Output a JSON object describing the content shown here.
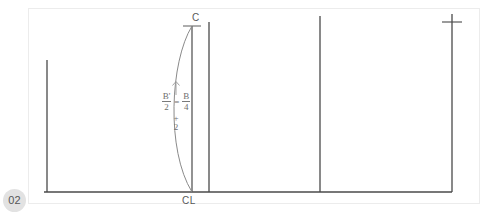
{
  "page": {
    "badge_number": "02",
    "background_color": "#ffffff",
    "frame_color": "#ececec",
    "line_color": "#4a4a4a",
    "text_color": "#585858"
  },
  "diagram": {
    "labels": {
      "top_station": "C",
      "centerline": "CL"
    },
    "annotation": {
      "arrow": "up-arrow",
      "formula_line1_left_num": "B'",
      "formula_line1_left_den": "2",
      "formula_equals": "=",
      "formula_line1_right_num": "B",
      "formula_line1_right_den": "4",
      "formula_line2_operator": "+",
      "formula_line2_value": "2",
      "plain_text": "B'/2 = B/4 + 2"
    }
  },
  "geometry": {
    "baseline": {
      "x1": 44,
      "y1": 192,
      "x2": 452,
      "y2": 192
    },
    "verticals": [
      {
        "name": "left-station-line",
        "x": 47,
        "y_top": 60,
        "y_bottom": 192
      },
      {
        "name": "centerline",
        "x": 192,
        "y_top": 26,
        "y_bottom": 192
      },
      {
        "name": "station-line-2",
        "x": 209,
        "y_top": 22,
        "y_bottom": 192
      },
      {
        "name": "station-line-3",
        "x": 320,
        "y_top": 16,
        "y_bottom": 192
      },
      {
        "name": "right-station-line",
        "x": 452,
        "y_top": 14,
        "y_bottom": 192
      }
    ],
    "tick_marks": [
      {
        "name": "tick-centerline-top",
        "x": 192,
        "y": 26,
        "half_width": 9
      },
      {
        "name": "tick-right-top",
        "x": 452,
        "y": 22,
        "half_width": 10
      }
    ],
    "curve": {
      "name": "hull-section-curve",
      "start": {
        "x": 192,
        "y": 26
      },
      "control": {
        "x": 160,
        "y": 112
      },
      "end": {
        "x": 192,
        "y": 192
      }
    }
  }
}
